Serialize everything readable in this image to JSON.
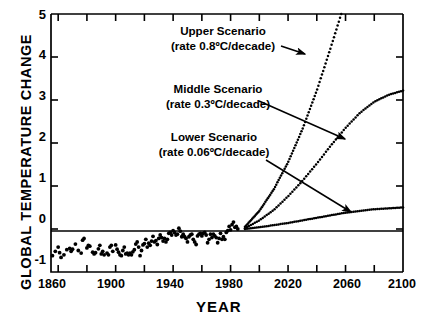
{
  "chart_data": {
    "type": "line",
    "title": "",
    "xlabel": "YEAR",
    "ylabel": "GLOBAL TEMPERATURE CHANGE",
    "xlim": [
      1855,
      2100
    ],
    "ylim": [
      -1,
      5
    ],
    "grid": false,
    "legend_position": "none",
    "xticks_major": [
      "1860",
      "1900",
      "1940",
      "1980",
      "2020",
      "2060",
      "2100"
    ],
    "xtick_major_values": [
      1860,
      1900,
      1940,
      1980,
      2020,
      2060,
      2100
    ],
    "xtick_minor_values": [
      1880,
      1920,
      1960,
      2000,
      2040,
      2080
    ],
    "yticks": [
      "5",
      "4",
      "3",
      "2",
      "1",
      "0",
      "-1"
    ],
    "ytick_values": [
      5,
      4,
      3,
      2,
      1,
      0,
      -1
    ],
    "zero_line": 0,
    "annotations": [
      {
        "name": "upper-scenario",
        "line1": "Upper Scenario",
        "line2": "(rate 0.8ºC/decade)",
        "rate_value": 0.8,
        "rate_units": "ºC/decade"
      },
      {
        "name": "middle-scenario",
        "line1": "Middle Scenario",
        "line2": "(rate 0.3ºC/decade)",
        "rate_value": 0.3,
        "rate_units": "ºC/decade"
      },
      {
        "name": "lower-scenario",
        "line1": "Lower Scenario",
        "line2": "(rate 0.06ºC/decade)",
        "rate_value": 0.06,
        "rate_units": "ºC/decade"
      }
    ],
    "series": [
      {
        "name": "Observed temperature record",
        "style": "scatter",
        "x": [
          1856,
          1858,
          1860,
          1861,
          1862,
          1864,
          1866,
          1868,
          1869,
          1870,
          1872,
          1874,
          1876,
          1877,
          1878,
          1880,
          1881,
          1882,
          1884,
          1885,
          1886,
          1888,
          1889,
          1890,
          1891,
          1892,
          1894,
          1895,
          1896,
          1897,
          1898,
          1900,
          1901,
          1902,
          1903,
          1904,
          1905,
          1906,
          1907,
          1908,
          1909,
          1910,
          1911,
          1912,
          1913,
          1914,
          1915,
          1916,
          1917,
          1918,
          1919,
          1920,
          1921,
          1922,
          1923,
          1924,
          1925,
          1926,
          1927,
          1928,
          1929,
          1930,
          1931,
          1932,
          1933,
          1934,
          1935,
          1936,
          1937,
          1938,
          1939,
          1940,
          1941,
          1942,
          1943,
          1944,
          1945,
          1946,
          1947,
          1948,
          1949,
          1950,
          1951,
          1952,
          1953,
          1954,
          1955,
          1956,
          1957,
          1958,
          1959,
          1960,
          1961,
          1962,
          1963,
          1964,
          1965,
          1966,
          1967,
          1968,
          1969,
          1970,
          1971,
          1972,
          1973,
          1974,
          1975,
          1976,
          1977,
          1978,
          1979,
          1980,
          1981,
          1982,
          1983,
          1984,
          1985
        ],
        "y": [
          -0.62,
          -0.52,
          -0.42,
          -0.55,
          -0.66,
          -0.6,
          -0.48,
          -0.45,
          -0.52,
          -0.47,
          -0.35,
          -0.5,
          -0.56,
          -0.26,
          -0.22,
          -0.44,
          -0.38,
          -0.4,
          -0.54,
          -0.58,
          -0.55,
          -0.46,
          -0.38,
          -0.58,
          -0.52,
          -0.6,
          -0.56,
          -0.6,
          -0.42,
          -0.38,
          -0.52,
          -0.37,
          -0.47,
          -0.54,
          -0.6,
          -0.62,
          -0.5,
          -0.42,
          -0.58,
          -0.56,
          -0.6,
          -0.56,
          -0.6,
          -0.53,
          -0.48,
          -0.35,
          -0.3,
          -0.42,
          -0.62,
          -0.5,
          -0.37,
          -0.34,
          -0.24,
          -0.42,
          -0.33,
          -0.38,
          -0.28,
          -0.17,
          -0.3,
          -0.27,
          -0.36,
          -0.22,
          -0.14,
          -0.2,
          -0.28,
          -0.22,
          -0.3,
          -0.24,
          -0.1,
          -0.08,
          -0.14,
          -0.04,
          -0.08,
          -0.14,
          -0.12,
          0.02,
          -0.05,
          -0.18,
          -0.12,
          -0.18,
          -0.22,
          -0.3,
          -0.18,
          -0.14,
          -0.12,
          -0.24,
          -0.3,
          -0.36,
          -0.16,
          -0.12,
          -0.1,
          -0.16,
          -0.1,
          -0.08,
          -0.14,
          -0.32,
          -0.24,
          -0.12,
          -0.2,
          -0.12,
          -0.16,
          -0.2,
          -0.32,
          -0.22,
          -0.1,
          -0.24,
          -0.18,
          -0.24,
          -0.08,
          -0.04,
          0.06,
          -0.02,
          0.1,
          0.16,
          0.04,
          0.06,
          0.0
        ]
      },
      {
        "name": "Upper Scenario",
        "style": "dotted",
        "x": [
          1990,
          2000,
          2010,
          2020,
          2030,
          2040,
          2050,
          2057
        ],
        "y": [
          0.05,
          0.42,
          0.92,
          1.55,
          2.32,
          3.22,
          4.25,
          5.0
        ]
      },
      {
        "name": "Middle Scenario",
        "style": "dotted",
        "x": [
          1990,
          2000,
          2010,
          2020,
          2030,
          2040,
          2050,
          2060,
          2070,
          2080,
          2090,
          2100
        ],
        "y": [
          0.02,
          0.2,
          0.44,
          0.76,
          1.12,
          1.52,
          1.95,
          2.35,
          2.7,
          2.96,
          3.12,
          3.22
        ]
      },
      {
        "name": "Lower Scenario",
        "style": "dotted",
        "x": [
          1990,
          2000,
          2010,
          2020,
          2030,
          2040,
          2050,
          2060,
          2070,
          2080,
          2090,
          2100
        ],
        "y": [
          0.0,
          0.04,
          0.09,
          0.14,
          0.2,
          0.26,
          0.32,
          0.38,
          0.42,
          0.46,
          0.48,
          0.5
        ]
      }
    ]
  },
  "axes": {
    "y_title": "GLOBAL TEMPERATURE CHANGE",
    "x_title": "YEAR",
    "y_labels": [
      "5",
      "4",
      "3",
      "2",
      "1",
      "0",
      "-1"
    ],
    "x_labels": [
      "1860",
      "1900",
      "1940",
      "1980",
      "2020",
      "2060",
      "2100"
    ]
  },
  "annotation_text": {
    "upper_line1": "Upper Scenario",
    "upper_line2": "(rate 0.8ºC/decade)",
    "middle_line1": "Middle Scenario",
    "middle_line2": "(rate 0.3ºC/decade)",
    "lower_line1": "Lower Scenario",
    "lower_line2": "(rate 0.06ºC/decade)"
  },
  "colors": {
    "ink": "#000000",
    "background": "#ffffff"
  }
}
